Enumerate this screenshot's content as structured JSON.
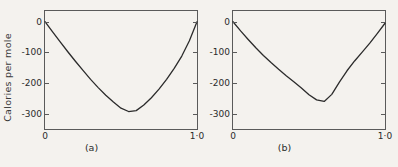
{
  "figure": {
    "ylabel": "Calories per mole",
    "panels": [
      {
        "caption": "(a)",
        "yticks": [
          "0",
          "-100",
          "-200",
          "-300"
        ],
        "ytick_values": [
          0,
          -100,
          -200,
          -300
        ],
        "xticks": [
          "0",
          "1·0"
        ],
        "xtick_values": [
          0,
          1.0
        ]
      },
      {
        "caption": "(b)",
        "yticks": [
          "0",
          "-100",
          "-200",
          "-300"
        ],
        "ytick_values": [
          0,
          -100,
          -200,
          -300
        ],
        "xticks": [
          "0",
          "1·0"
        ],
        "xtick_values": [
          0,
          1.0
        ]
      }
    ]
  },
  "chart_data": [
    {
      "type": "line",
      "title": "(a)",
      "xlabel": "",
      "ylabel": "Calories per mole",
      "xlim": [
        0,
        1.0
      ],
      "ylim": [
        -350,
        35
      ],
      "grid": false,
      "legend": "none",
      "xticks": [
        0,
        1.0
      ],
      "xticklabels": [
        "0",
        "1·0"
      ],
      "yticks": [
        0,
        -100,
        -200,
        -300
      ],
      "yticklabels": [
        "0",
        "-100",
        "-200",
        "-300"
      ],
      "x": [
        0.0,
        0.05,
        0.1,
        0.15,
        0.2,
        0.25,
        0.3,
        0.35,
        0.4,
        0.45,
        0.5,
        0.55,
        0.6,
        0.65,
        0.7,
        0.75,
        0.8,
        0.85,
        0.9,
        0.95,
        1.0
      ],
      "y": [
        0,
        -33,
        -66,
        -98,
        -129,
        -159,
        -188,
        -215,
        -240,
        -262,
        -282,
        -293,
        -290,
        -272,
        -248,
        -220,
        -188,
        -152,
        -112,
        -62,
        0
      ]
    },
    {
      "type": "line",
      "title": "(b)",
      "xlabel": "",
      "ylabel": "Calories per mole",
      "xlim": [
        0,
        1.0
      ],
      "ylim": [
        -350,
        35
      ],
      "grid": false,
      "legend": "none",
      "xticks": [
        0,
        1.0
      ],
      "xticklabels": [
        "0",
        "1·0"
      ],
      "yticks": [
        0,
        -100,
        -200,
        -300
      ],
      "yticklabels": [
        "0",
        "-100",
        "-200",
        "-300"
      ],
      "x": [
        0.0,
        0.05,
        0.1,
        0.15,
        0.2,
        0.25,
        0.3,
        0.35,
        0.4,
        0.45,
        0.5,
        0.55,
        0.6,
        0.65,
        0.7,
        0.75,
        0.8,
        0.85,
        0.9,
        0.95,
        1.0
      ],
      "y": [
        0,
        -30,
        -58,
        -85,
        -110,
        -133,
        -155,
        -176,
        -196,
        -216,
        -238,
        -255,
        -260,
        -237,
        -197,
        -160,
        -128,
        -99,
        -70,
        -38,
        -5
      ]
    }
  ]
}
